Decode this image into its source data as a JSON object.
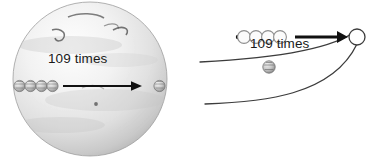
{
  "figure": {
    "type": "diagram",
    "background_color": "#ffffff",
    "width": 379,
    "height": 167
  },
  "panels": [
    {
      "id": "sun-panel",
      "name": "sun-disk-panel",
      "scale_label": "109 times",
      "body": {
        "name": "sun-disk",
        "center_x": 90,
        "center_y": 79,
        "radius": 77,
        "fill_colors": [
          "#fdfdfd",
          "#eeeeee",
          "#d8d8d8",
          "#bdbdbd"
        ],
        "edge_color": "#9a9a9a"
      },
      "surface_features": [
        {
          "name": "solar-filament-left",
          "color": "#4a4a4a"
        },
        {
          "name": "solar-filament-right",
          "color": "#4a4a4a"
        },
        {
          "name": "solar-filament-top",
          "color": "#5a5a5a"
        },
        {
          "name": "sunspot-center",
          "color": "#6b6b6b"
        }
      ],
      "earth_spheres": [
        {
          "name": "earth-sphere-1",
          "cx": 19.5,
          "cy": 86,
          "r": 5.6
        },
        {
          "name": "earth-sphere-2",
          "cx": 30.5,
          "cy": 86,
          "r": 5.6
        },
        {
          "name": "earth-sphere-3",
          "cx": 41.5,
          "cy": 86,
          "r": 5.6
        },
        {
          "name": "earth-sphere-4",
          "cx": 52.5,
          "cy": 86,
          "r": 5.6
        },
        {
          "name": "earth-sphere-edge",
          "cx": 159.5,
          "cy": 86,
          "r": 5.6
        }
      ],
      "arrow": {
        "name": "scale-arrow",
        "from_x": 63,
        "to_x": 137,
        "y": 86,
        "color": "#111111"
      }
    },
    {
      "id": "lens-panel",
      "name": "lens-outline-panel",
      "scale_label": "109 times",
      "outline": {
        "name": "lens-outline",
        "stroke_color": "#3c3c3c",
        "vertex_x": 174,
        "vertex_y": 37
      },
      "earth_spheres": [
        {
          "name": "earth-dot-marker",
          "cx": 48,
          "cy": 37,
          "r": 2.2
        },
        {
          "name": "earth-outline-1",
          "cx": 54,
          "cy": 37,
          "r": 6.4
        },
        {
          "name": "earth-outline-2",
          "cx": 66,
          "cy": 37,
          "r": 6.4
        },
        {
          "name": "earth-outline-3",
          "cx": 78,
          "cy": 37,
          "r": 6.4
        },
        {
          "name": "earth-outline-4",
          "cx": 90,
          "cy": 37,
          "r": 6.4
        },
        {
          "name": "earth-sphere-on-arc",
          "cx": 79,
          "cy": 67,
          "r": 6.2
        }
      ],
      "sun-circle": {
        "name": "sun-circle-small",
        "cx": 167,
        "cy": 37,
        "r": 8.0,
        "fill": "#ffffff",
        "stroke": "#3c3c3c"
      },
      "arrow": {
        "name": "scale-arrow",
        "from_x": 105,
        "to_x": 158,
        "y": 37,
        "color": "#111111"
      }
    }
  ]
}
